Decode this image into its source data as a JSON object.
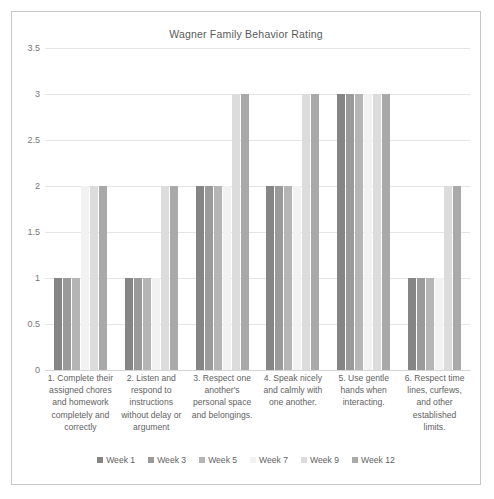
{
  "chart_data": {
    "type": "bar",
    "title": "Wagner Family Behavior Rating",
    "xlabel": "",
    "ylabel": "",
    "ylim": [
      0,
      3.5
    ],
    "ytick_labels": [
      "3.5",
      "3",
      "2.5",
      "2",
      "1.5",
      "1",
      "0.5",
      "0"
    ],
    "ytick_values": [
      3.5,
      3,
      2.5,
      2,
      1.5,
      1,
      0.5,
      0
    ],
    "grid": true,
    "legend_position": "bottom",
    "categories": [
      "1. Complete their assigned chores and homework completely and correctly",
      "2. Listen and respond to instructions without delay or argument",
      "3. Respect one another's personal space and belongings.",
      "4. Speak nicely and calmly with one another.",
      "5. Use gentle hands when interacting.",
      "6. Respect time lines, curfews, and other established limits."
    ],
    "series": [
      {
        "name": "Week 1",
        "color": "#858585",
        "values": [
          1,
          1,
          2,
          2,
          3,
          1
        ]
      },
      {
        "name": "Week 3",
        "color": "#9a9a9a",
        "values": [
          1,
          1,
          2,
          2,
          3,
          1
        ]
      },
      {
        "name": "Week 5",
        "color": "#b5b5b5",
        "values": [
          1,
          1,
          2,
          2,
          3,
          1
        ]
      },
      {
        "name": "Week 7",
        "color": "#f2f2f2",
        "values": [
          2,
          1,
          2,
          2,
          3,
          1
        ]
      },
      {
        "name": "Week 9",
        "color": "#dcdcdc",
        "values": [
          2,
          2,
          3,
          3,
          3,
          2
        ]
      },
      {
        "name": "Week 12",
        "color": "#a9a9a9",
        "values": [
          2,
          2,
          3,
          3,
          3,
          2
        ]
      }
    ]
  },
  "colors": {
    "frame_border": "#c8c8c8",
    "gridline": "#e4e4e4",
    "text": "#5f5f5f",
    "background": "#ffffff"
  }
}
